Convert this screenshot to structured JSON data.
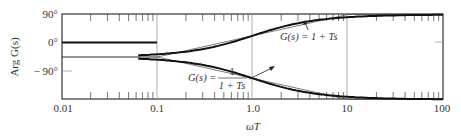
{
  "chart_data": {
    "type": "line",
    "title": "",
    "xlabel": "ωT",
    "ylabel": "Arg G(s)",
    "xscale": "log",
    "xlim": [
      0.01,
      100
    ],
    "ylim": [
      -90,
      90
    ],
    "x_ticks": [
      "0.01",
      "0.1",
      "1.0",
      "10",
      "100"
    ],
    "y_ticks": [
      "90°",
      "0°",
      "− 90°"
    ],
    "grid": "vertical decade lines only",
    "series": [
      {
        "name": "G(s) = 1 + Ts (exact)",
        "style": "thick",
        "x": [
          0.01,
          0.1,
          0.2,
          0.5,
          1.0,
          2.0,
          5.0,
          10,
          100
        ],
        "values": [
          0.6,
          5.7,
          11.3,
          26.6,
          45,
          63.4,
          78.7,
          84.3,
          89.4
        ]
      },
      {
        "name": "G(s) = 1 + Ts (asymptotic approx.)",
        "style": "thin",
        "x": [
          0.01,
          0.1,
          1.0,
          10,
          100
        ],
        "values": [
          0,
          0,
          45,
          90,
          90
        ]
      },
      {
        "name": "G(s) = 1/(1 + Ts) (exact)",
        "style": "thick",
        "x": [
          0.01,
          0.1,
          0.2,
          0.5,
          1.0,
          2.0,
          5.0,
          10,
          100
        ],
        "values": [
          -0.6,
          -5.7,
          -11.3,
          -26.6,
          -45,
          -63.4,
          -78.7,
          -84.3,
          -89.4
        ]
      },
      {
        "name": "G(s) = 1/(1 + Ts) (asymptotic approx.)",
        "style": "thin",
        "x": [
          0.01,
          0.1,
          1.0,
          10,
          100
        ],
        "values": [
          0,
          0,
          -45,
          -90,
          -90
        ]
      }
    ],
    "annotations": [
      {
        "text": "G(s) = 1 + Ts",
        "points_to": "upper curve near ωT≈5"
      },
      {
        "text": "G(s) = 1 / (1 + Ts)",
        "points_to": "lower curve near ωT≈2"
      }
    ]
  },
  "labels": {
    "y_axis": "Arg G(s)",
    "x_axis": "ωT",
    "y90": "90°",
    "y0": "0°",
    "ym90": "− 90°",
    "x0": "0.01",
    "x1": "0.1",
    "x2": "1.0",
    "x3": "10",
    "x4": "100",
    "ann_upper_prefix": "G(s) = 1 + Ts",
    "ann_lower_prefix": "G(s) =",
    "ann_lower_num": "1",
    "ann_lower_den": "1 + Ts"
  }
}
